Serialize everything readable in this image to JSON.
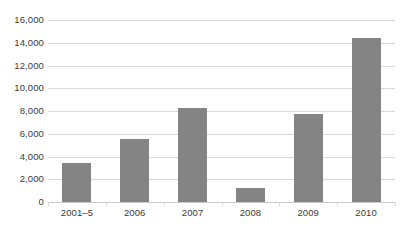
{
  "chart_data": {
    "type": "bar",
    "title": "",
    "subtitle": "",
    "xlabel": "",
    "ylabel": "",
    "categories": [
      "2001–5",
      "2006",
      "2007",
      "2008",
      "2009",
      "2010"
    ],
    "values": [
      3400,
      5550,
      8300,
      1200,
      7700,
      14400
    ],
    "series": [
      {
        "name": "",
        "values": [
          3400,
          5550,
          8300,
          1200,
          7700,
          14400
        ]
      }
    ],
    "ylim": [
      0,
      16000
    ],
    "ytick_values": [
      0,
      2000,
      4000,
      6000,
      8000,
      10000,
      12000,
      14000,
      16000
    ],
    "ytick_labels": [
      "0",
      "2,000",
      "4,000",
      "6,000",
      "8,000",
      "10,000",
      "12,000",
      "14,000",
      "16,000"
    ],
    "grid": true,
    "legend": false,
    "legend_position": "none",
    "bar_color": "#848484",
    "gridline_color": "#d9d9d9",
    "axis_color": "#c8c8c8",
    "text_color": "#3a3a3a",
    "background_color": "#ffffff"
  }
}
